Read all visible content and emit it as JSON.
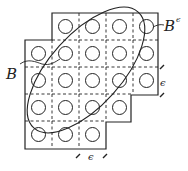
{
  "diagram": {
    "type": "covering-grid",
    "stroke_color": "#222222",
    "grid": {
      "origin_x": 25,
      "origin_y": 13,
      "cell_size": 27,
      "cells": [
        [
          0,
          1
        ],
        [
          0,
          2
        ],
        [
          0,
          3
        ],
        [
          0,
          4
        ],
        [
          1,
          0
        ],
        [
          1,
          1
        ],
        [
          1,
          2
        ],
        [
          1,
          3
        ],
        [
          1,
          4
        ],
        [
          2,
          0
        ],
        [
          2,
          1
        ],
        [
          2,
          2
        ],
        [
          2,
          3
        ],
        [
          2,
          4
        ],
        [
          3,
          0
        ],
        [
          3,
          1
        ],
        [
          3,
          2
        ],
        [
          3,
          3
        ],
        [
          4,
          0
        ],
        [
          4,
          1
        ],
        [
          4,
          2
        ]
      ],
      "circle_radius": 7
    },
    "ellipse": {
      "cx": 86,
      "cy": 70,
      "rx": 78,
      "ry": 36,
      "rotation": -48
    },
    "labels": {
      "set_b": "B",
      "set_b_eps": "B",
      "set_b_eps_sup": "ϵ",
      "epsilon_right": "ϵ",
      "epsilon_bottom": "ϵ"
    }
  }
}
